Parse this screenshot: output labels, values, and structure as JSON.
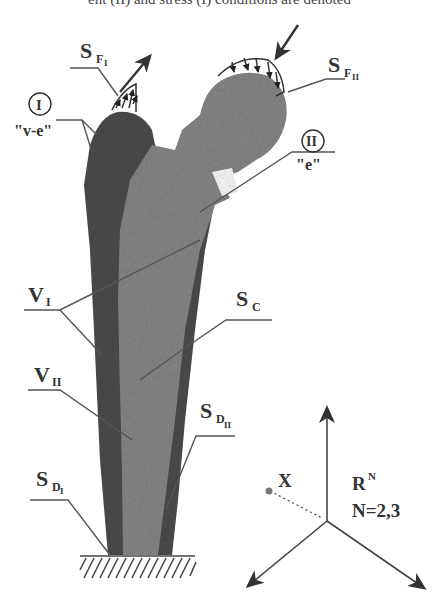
{
  "caption_fragment": "ent (II) and stress (I) conditions are denoted",
  "labels": {
    "sf1": {
      "main": "S",
      "sub": "F",
      "subsub": "I"
    },
    "sf2": {
      "main": "S",
      "sub": "F",
      "subsub": "II"
    },
    "region1_num": "I",
    "region1_type": "\"v-e\"",
    "region2_num": "II",
    "region2_type": "\"e\"",
    "v1": {
      "main": "V",
      "sub": "I"
    },
    "sc": {
      "main": "S",
      "sub": "C"
    },
    "v2": {
      "main": "V",
      "sub": "II"
    },
    "sd2": {
      "main": "S",
      "sub": "D",
      "subsub": "II"
    },
    "sd1": {
      "main": "S",
      "sub": "D",
      "subsub": "I"
    },
    "point": "X",
    "space": {
      "main": "R",
      "sup": "N"
    },
    "dims": "N=2,3"
  },
  "colors": {
    "outer_body": "#555555",
    "inner_body": "#8a8a8a",
    "line": "#444444",
    "point": "#777777"
  }
}
